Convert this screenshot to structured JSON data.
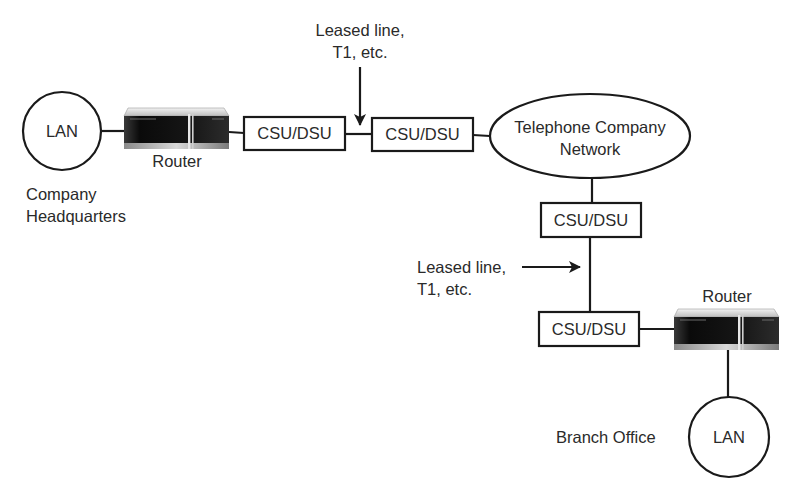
{
  "diagram": {
    "type": "network-topology",
    "headquarters": {
      "lan_label": "LAN",
      "router_label": "Router",
      "site_label_line1": "Company",
      "site_label_line2": "Headquarters"
    },
    "csu_dsu_label": "CSU/DSU",
    "csu_dsu_boxes": [
      {
        "label": "CSU/DSU"
      },
      {
        "label": "CSU/DSU"
      },
      {
        "label": "CSU/DSU"
      },
      {
        "label": "CSU/DSU"
      }
    ],
    "leased_line_top": {
      "line1": "Leased line,",
      "line2": "T1, etc."
    },
    "telco_network": {
      "line1": "Telephone Company",
      "line2": "Network"
    },
    "leased_line_side": {
      "line1": "Leased line,",
      "line2": "T1, etc."
    },
    "branch": {
      "router_label": "Router",
      "lan_label": "LAN",
      "site_label": "Branch Office"
    },
    "colors": {
      "stroke": "#1a1a1a",
      "text": "#2a2a2a",
      "background": "#ffffff"
    }
  }
}
